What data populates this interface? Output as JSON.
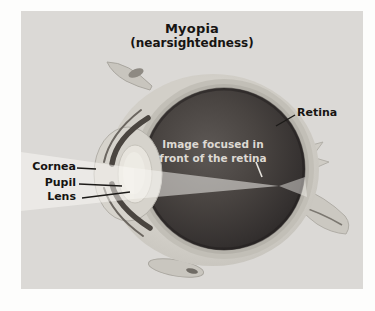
{
  "figure": {
    "title": "Myopia",
    "subtitle": "(nearsightedness)",
    "labels": {
      "retina": "Retina",
      "cornea": "Cornea",
      "pupil": "Pupil",
      "lens": "Lens"
    },
    "annotation": {
      "line1": "Image focused in",
      "line2": "front of the retina"
    },
    "colors": {
      "page_bg": "#ffffff",
      "panel_bg": "#dbd9d6",
      "sclera": "#d2cfc8",
      "choroid_ring": "#c2bfb7",
      "retina_layer": "#b5b2aa",
      "vitreous_dark": "#2a2726",
      "vitreous_light": "#5d5855",
      "lens_fill": "#e7e4dd",
      "light_beam": "rgba(250,248,244,0.5)",
      "label_text": "#161412",
      "annotation_text": "#ddd9d3"
    }
  }
}
